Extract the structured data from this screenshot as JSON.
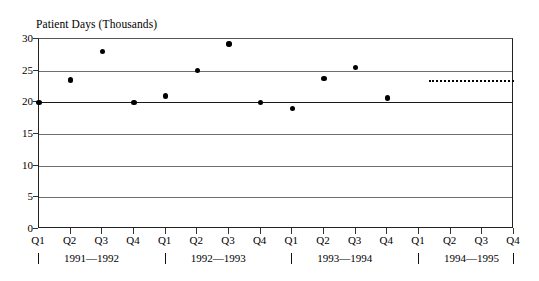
{
  "chart_data": {
    "type": "scatter",
    "title": "Patient Days (Thousands)",
    "xlabel": "",
    "ylabel": "",
    "ylim": [
      0,
      30
    ],
    "yticks": [
      0,
      5,
      10,
      15,
      20,
      25,
      30
    ],
    "ytick_labels": [
      "0",
      "5",
      "10",
      "15",
      "20",
      "25",
      "30"
    ],
    "grid": true,
    "legend": "none",
    "categories": [
      "Q1",
      "Q2",
      "Q3",
      "Q4",
      "Q1",
      "Q2",
      "Q3",
      "Q4",
      "Q1",
      "Q2",
      "Q3",
      "Q4",
      "Q1",
      "Q2",
      "Q3",
      "Q4"
    ],
    "series": [
      {
        "name": "Patient Days",
        "values": [
          20.0,
          23.5,
          28.0,
          20.0,
          21.0,
          25.0,
          29.2,
          20.0,
          19.0,
          23.8,
          25.5,
          20.7,
          null,
          null,
          null,
          null
        ]
      }
    ],
    "annotations": [
      {
        "name": "projection-line",
        "type": "dotted-horizontal-line",
        "value": 23.5,
        "x_start_category_index": 12.3,
        "x_end_category_index": 15.0,
        "style": "dotted"
      }
    ],
    "fiscal_years": [
      {
        "label": "1991—1992",
        "start_index": 0,
        "end_index": 3
      },
      {
        "label": "1992—1993",
        "start_index": 4,
        "end_index": 7
      },
      {
        "label": "1993—1994",
        "start_index": 8,
        "end_index": 11
      },
      {
        "label": "1994—1995",
        "start_index": 12,
        "end_index": 15
      }
    ],
    "colors": {
      "marker": "#000000",
      "gridline": "#6f6f6f",
      "axis": "#222222",
      "background": "#ffffff"
    }
  }
}
